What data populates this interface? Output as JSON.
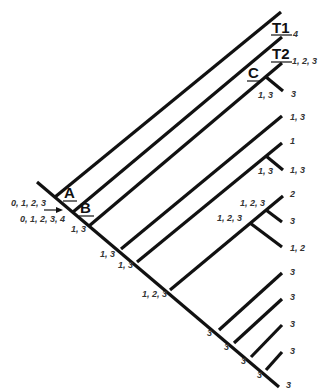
{
  "diagram": {
    "type": "cladogram",
    "nodes": [
      {
        "id": "A",
        "label": "A"
      },
      {
        "id": "B",
        "label": "B"
      },
      {
        "id": "C",
        "label": "C"
      },
      {
        "id": "T1",
        "label": "T1"
      },
      {
        "id": "T2",
        "label": "T2"
      }
    ],
    "root_labels": {
      "arrow_label": "0, 1, 2, 3",
      "below_label": "0, 1, 2, 3, 4"
    },
    "tip_labels": {
      "t1": "4",
      "t2": "1, 2, 3",
      "c_sub": "3",
      "b4": "1, 3",
      "b5": "1",
      "b5_sub": "1, 3",
      "b6": "2",
      "b6_sub1": "3",
      "b6_sub2": "1, 2",
      "b7": "3",
      "b8": "3",
      "b9": "3",
      "b10": "3",
      "trunk_end": "3"
    },
    "node_labels": {
      "b_junction": "1, 3",
      "c_junction": "1, 3",
      "b4_junction": "1, 3",
      "b5_junction": "1, 3",
      "b5_sub_junction": "1, 3",
      "b6_junction": "1, 2, 3",
      "b6_sub1_junction": "1, 2, 3",
      "b6_sub2_junction": "1, 2, 3",
      "b7_junction": "3",
      "b8_junction": "3",
      "b9_junction": "3",
      "b10_junction": "3"
    },
    "colors": {
      "line": "#111111",
      "text": "#333333",
      "background": "#ffffff"
    }
  }
}
